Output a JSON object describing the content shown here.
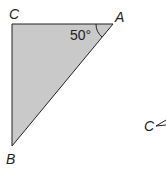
{
  "diagram": {
    "type": "right-triangle",
    "fill_color": "#c9c9c9",
    "stroke_color": "#222222",
    "vertices": {
      "C": {
        "label": "C"
      },
      "A": {
        "label": "A"
      },
      "B": {
        "label": "B"
      }
    },
    "angle_A": "50°",
    "partial_figure": {
      "label": "C"
    }
  }
}
